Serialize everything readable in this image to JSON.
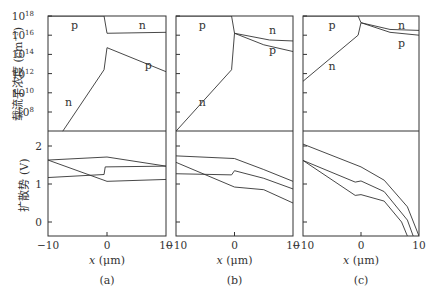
{
  "chart_data": [
    {
      "panel": "(a)",
      "type": "line",
      "subplots": [
        {
          "name": "carrier-concentration",
          "ylabel": "载流子浓度 (cm^-3)",
          "yscale": "log",
          "ylim_log10": [
            6,
            18
          ],
          "yticks": [
            "10^18",
            "10^16",
            "10^14",
            "10^12",
            "10^10",
            "10^8"
          ],
          "xlim": [
            -10,
            10
          ],
          "series": [
            {
              "name": "p",
              "x": [
                -10,
                -0.5,
                0
              ],
              "log10": [
                18,
                18,
                16.2
              ]
            },
            {
              "name": "n (left)",
              "x": [
                -7.5,
                -0.5,
                0
              ],
              "log10": [
                6,
                12.4,
                14.7
              ]
            },
            {
              "name": "n (right)",
              "x": [
                0,
                10
              ],
              "log10": [
                16.2,
                16.3
              ]
            },
            {
              "name": "p (right)",
              "x": [
                0,
                10
              ],
              "log10": [
                14.7,
                12.2
              ]
            }
          ],
          "annotations": [
            {
              "text": "p",
              "x": -5.5,
              "log10": 17.1
            },
            {
              "text": "n",
              "x": 6,
              "log10": 17.1
            },
            {
              "text": "p",
              "x": 7,
              "log10": 12.9
            },
            {
              "text": "n",
              "x": -6.5,
              "log10": 9.0
            }
          ]
        },
        {
          "name": "diffusion-potential",
          "ylabel": "扩散势 (V)",
          "yscale": "linear",
          "ylim": [
            -0.37,
            2.4
          ],
          "yticks": [
            0,
            1,
            2
          ],
          "xlim": [
            -10,
            10
          ],
          "xlabel": "x (μm)",
          "xticks": [
            -10,
            0,
            10
          ],
          "series": [
            {
              "name": "curve1",
              "x": [
                -10,
                0,
                10
              ],
              "values": [
                1.63,
                1.71,
                1.47
              ]
            },
            {
              "name": "curve2",
              "x": [
                -10,
                -0.5,
                -0.3,
                10
              ],
              "values": [
                1.17,
                1.25,
                1.45,
                1.47
              ]
            },
            {
              "name": "curve3",
              "x": [
                -10,
                0,
                10
              ],
              "values": [
                1.63,
                1.07,
                1.12
              ]
            }
          ]
        }
      ]
    },
    {
      "panel": "(b)",
      "type": "line",
      "subplots": [
        {
          "name": "carrier-concentration",
          "yscale": "log",
          "ylim_log10": [
            6,
            18
          ],
          "xlim": [
            -10,
            10
          ],
          "series": [
            {
              "name": "p",
              "x": [
                -10,
                -0.5,
                0
              ],
              "log10": [
                18,
                18,
                16.2
              ]
            },
            {
              "name": "n (left)",
              "x": [
                -10,
                -0.5,
                0
              ],
              "log10": [
                6,
                12.4,
                16.2
              ]
            },
            {
              "name": "n (right)",
              "x": [
                0,
                6,
                10
              ],
              "log10": [
                16.2,
                15.5,
                15.4
              ]
            },
            {
              "name": "p (right)",
              "x": [
                0,
                5,
                10
              ],
              "log10": [
                16.2,
                15.0,
                14.3
              ]
            }
          ],
          "annotations": [
            {
              "text": "p",
              "x": -5.5,
              "log10": 17.1
            },
            {
              "text": "n",
              "x": 6.5,
              "log10": 16.5
            },
            {
              "text": "p",
              "x": 6.5,
              "log10": 14.5
            },
            {
              "text": "n",
              "x": -5.5,
              "log10": 9.0
            }
          ]
        },
        {
          "name": "diffusion-potential",
          "yscale": "linear",
          "ylim": [
            -0.37,
            2.4
          ],
          "xlim": [
            -10,
            10
          ],
          "xlabel": "x (μm)",
          "xticks": [
            -10,
            0,
            10
          ],
          "series": [
            {
              "name": "curve1",
              "x": [
                -10,
                0,
                5,
                10
              ],
              "values": [
                1.74,
                1.67,
                1.38,
                1.07
              ]
            },
            {
              "name": "curve2",
              "x": [
                -10,
                -0.5,
                0,
                5,
                10
              ],
              "values": [
                1.27,
                1.24,
                1.35,
                1.15,
                0.87
              ]
            },
            {
              "name": "curve3",
              "x": [
                -10,
                0,
                5,
                10
              ],
              "values": [
                1.57,
                0.92,
                0.85,
                0.5
              ]
            }
          ]
        }
      ]
    },
    {
      "panel": "(c)",
      "type": "line",
      "subplots": [
        {
          "name": "carrier-concentration",
          "yscale": "log",
          "ylim_log10": [
            6,
            18
          ],
          "xlim": [
            -10,
            10
          ],
          "series": [
            {
              "name": "p",
              "x": [
                -10,
                -0.5,
                0
              ],
              "log10": [
                18,
                18,
                17.3
              ]
            },
            {
              "name": "n (left)",
              "x": [
                -10,
                -0.5,
                0
              ],
              "log10": [
                11.2,
                16.0,
                17.3
              ]
            },
            {
              "name": "n (right)",
              "x": [
                0,
                5,
                10
              ],
              "log10": [
                17.3,
                16.6,
                16.5
              ]
            },
            {
              "name": "p (right)",
              "x": [
                0,
                5,
                10
              ],
              "log10": [
                17.3,
                16.3,
                16.0
              ]
            }
          ],
          "annotations": [
            {
              "text": "p",
              "x": -5,
              "log10": 17.1
            },
            {
              "text": "n",
              "x": 7,
              "log10": 17.1
            },
            {
              "text": "p",
              "x": 7,
              "log10": 15.2
            },
            {
              "text": "n",
              "x": -5,
              "log10": 12.8
            }
          ]
        },
        {
          "name": "diffusion-potential",
          "yscale": "linear",
          "ylim": [
            -0.37,
            2.4
          ],
          "xlim": [
            -10,
            10
          ],
          "xlabel": "x (μm)",
          "xticks": [
            -10,
            0,
            10
          ],
          "series": [
            {
              "name": "curve1",
              "x": [
                -10,
                0,
                4,
                8,
                10
              ],
              "values": [
                2.05,
                1.45,
                1.1,
                0.4,
                -0.37
              ]
            },
            {
              "name": "curve2",
              "x": [
                -10,
                -1,
                0,
                4,
                8,
                9
              ],
              "values": [
                1.62,
                1.05,
                1.08,
                0.8,
                0.05,
                -0.37
              ]
            },
            {
              "name": "curve3",
              "x": [
                -10,
                -1,
                0,
                4,
                7,
                8
              ],
              "values": [
                1.62,
                0.7,
                0.72,
                0.55,
                0.0,
                -0.37
              ]
            }
          ]
        }
      ]
    }
  ],
  "labels": {
    "ylabel_top": "载流子浓度",
    "ylabel_top_unit": "(cm",
    "ylabel_top_exp": "−3",
    "ylabel_top_close": ")",
    "ylabel_bottom": "扩散势 (V)",
    "xlabel": "x (μm)",
    "panel_a": "(a)",
    "panel_b": "(b)",
    "panel_c": "(c)",
    "xtick_neg": "−10",
    "xtick_zero": "0",
    "xtick_pos": "10",
    "ytick_bot_2": "2",
    "ytick_bot_1": "1",
    "ytick_bot_0": "0",
    "ytick_top_base": "10",
    "ytick_top_exps": [
      "18",
      "16",
      "14",
      "12",
      "10",
      "8"
    ]
  }
}
